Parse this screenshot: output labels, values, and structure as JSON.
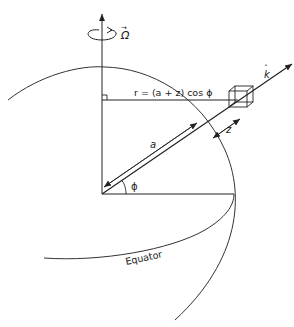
{
  "diagram": {
    "labels": {
      "omega": "Ω",
      "omega_arrow": "→",
      "k_hat": "k",
      "k_hat_mark": "ˆ",
      "radius_formula": "r = (a + z) cos ϕ",
      "a": "a",
      "z": "z",
      "phi": "ϕ",
      "equator": "Equator"
    },
    "colors": {
      "stroke": "#222222",
      "background": "#ffffff"
    }
  }
}
